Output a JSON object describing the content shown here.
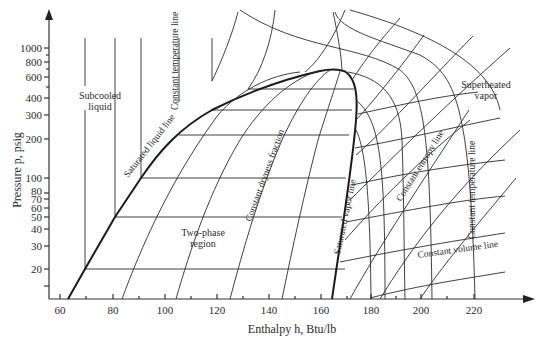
{
  "diagram": {
    "type": "pressure-enthalpy (p-h) diagram",
    "x_axis": {
      "label": "Enthalpy h, Btu/lb",
      "ticks": [
        "60",
        "80",
        "100",
        "120",
        "140",
        "160",
        "180",
        "200",
        "220"
      ]
    },
    "y_axis": {
      "label": "Pressure p, psig",
      "ticks": [
        "1000",
        "800",
        "600",
        "400",
        "300",
        "200",
        "100",
        "80",
        "70",
        "60",
        "50",
        "40",
        "30",
        "20"
      ]
    },
    "regions": {
      "subcooled": [
        "Subcooled",
        "liquid"
      ],
      "two_phase": [
        "Two-phase",
        "region"
      ],
      "superheated": [
        "Superheated",
        "vapor"
      ]
    },
    "line_labels": {
      "const_temp_left": "Constant temperature line",
      "sat_liquid": "Saturated liquid line",
      "const_dryness": "Constant dryness fraction",
      "sat_vapor": "Saturated vapor line",
      "const_entropy": "Constant entropy line",
      "const_temp_right": "Constant temperature line",
      "const_volume": "Constant volume line"
    },
    "colors": {
      "ink": "#2a2a2a",
      "background": "#ffffff"
    }
  }
}
